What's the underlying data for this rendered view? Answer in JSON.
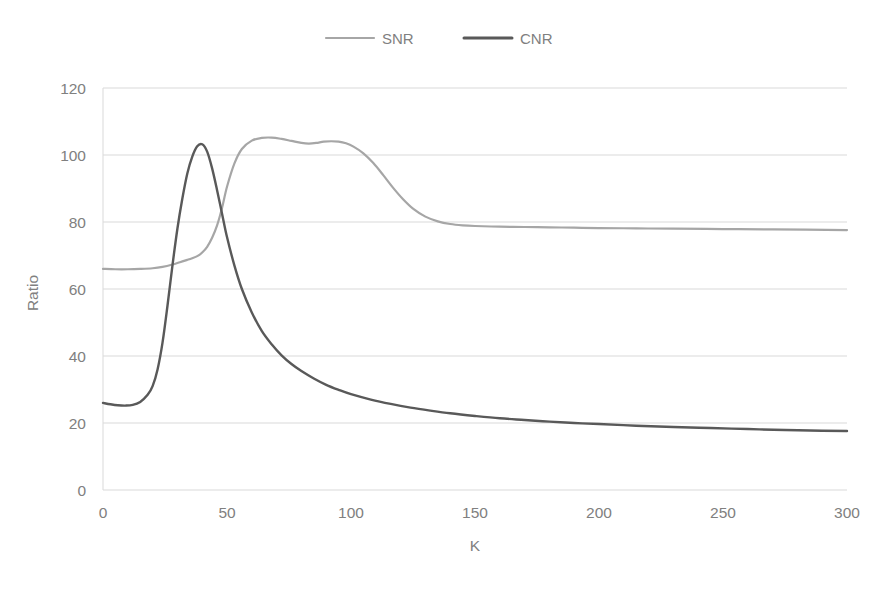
{
  "chart_data": {
    "type": "line",
    "title": "",
    "subtitle": "",
    "xlabel": "K",
    "ylabel": "Ratio",
    "xlim": [
      0,
      300
    ],
    "ylim": [
      0,
      120
    ],
    "xticks": [
      0,
      50,
      100,
      150,
      200,
      250,
      300
    ],
    "yticks": [
      0,
      20,
      40,
      60,
      80,
      100,
      120
    ],
    "xtick_labels": [
      "0",
      "50",
      "100",
      "150",
      "200",
      "250",
      "300"
    ],
    "ytick_labels": [
      "0",
      "20",
      "40",
      "60",
      "80",
      "100",
      "120"
    ],
    "grid": "horizontal",
    "legend_position": "top-center",
    "annotations": [],
    "series": [
      {
        "name": "SNR",
        "color": "#a6a6a6",
        "width": 2.2,
        "x": [
          0,
          5,
          10,
          15,
          20,
          24,
          28,
          31,
          34,
          36,
          38,
          40,
          42,
          44,
          46,
          48,
          50,
          53,
          56,
          60,
          64,
          68,
          72,
          76,
          80,
          83,
          86,
          89,
          92,
          95,
          98,
          101,
          105,
          109,
          113,
          117,
          121,
          125,
          130,
          135,
          140,
          145,
          150,
          160,
          170,
          180,
          190,
          200,
          215,
          230,
          250,
          270,
          300
        ],
        "y": [
          66.0,
          65.9,
          65.9,
          66.0,
          66.2,
          66.6,
          67.3,
          68.0,
          68.7,
          69.2,
          69.8,
          70.9,
          72.6,
          75.3,
          79.0,
          84.2,
          90.5,
          97.5,
          101.8,
          104.3,
          105.1,
          105.2,
          104.8,
          104.2,
          103.6,
          103.4,
          103.6,
          104.0,
          104.1,
          104.0,
          103.5,
          102.5,
          100.5,
          97.6,
          94.0,
          90.2,
          86.8,
          84.0,
          81.6,
          80.2,
          79.4,
          79.0,
          78.8,
          78.6,
          78.5,
          78.4,
          78.3,
          78.2,
          78.1,
          78.0,
          77.9,
          77.8,
          77.6
        ]
      },
      {
        "name": "CNR",
        "color": "#595959",
        "width": 2.4,
        "x": [
          0,
          3,
          6,
          9,
          12,
          15,
          18,
          20,
          22,
          24,
          26,
          28,
          30,
          32,
          34,
          36,
          38,
          40,
          42,
          44,
          46,
          48,
          50,
          53,
          56,
          60,
          64,
          68,
          72,
          76,
          80,
          85,
          90,
          95,
          100,
          108,
          116,
          124,
          132,
          140,
          150,
          160,
          170,
          180,
          190,
          200,
          215,
          230,
          245,
          260,
          275,
          290,
          300
        ],
        "y": [
          26.0,
          25.6,
          25.3,
          25.2,
          25.4,
          26.3,
          28.4,
          31.0,
          36.0,
          44.0,
          55.0,
          67.0,
          78.0,
          87.0,
          94.5,
          99.5,
          102.6,
          103.2,
          101.0,
          96.0,
          89.5,
          82.5,
          75.5,
          67.0,
          60.0,
          53.0,
          47.5,
          43.5,
          40.2,
          37.6,
          35.5,
          33.3,
          31.4,
          29.9,
          28.6,
          27.0,
          25.7,
          24.6,
          23.7,
          22.9,
          22.1,
          21.4,
          20.9,
          20.4,
          20.0,
          19.7,
          19.2,
          18.8,
          18.5,
          18.2,
          17.9,
          17.7,
          17.6
        ]
      }
    ]
  },
  "legend": {
    "items": [
      {
        "label": "SNR",
        "color": "#a6a6a6"
      },
      {
        "label": "CNR",
        "color": "#595959"
      }
    ]
  },
  "axes": {
    "x_title": "K",
    "y_title": "Ratio"
  }
}
